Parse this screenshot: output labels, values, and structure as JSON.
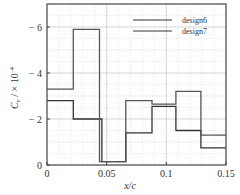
{
  "chart_data": {
    "type": "line",
    "title": "",
    "xlabel": "x/c",
    "ylabel": "C_v / × 10^-4",
    "xlim": [
      0,
      0.15
    ],
    "ylim": [
      0,
      -7
    ],
    "x_ticks": [
      "0",
      "0.05",
      "0.1",
      "0.15"
    ],
    "y_ticks": [
      "0",
      "− 2",
      "− 4",
      "− 6"
    ],
    "grid": true,
    "legend_position": "upper right",
    "series": [
      {
        "name": "design6",
        "step": true,
        "x": [
          0,
          0.022,
          0.022,
          0.046,
          0.046,
          0.066,
          0.066,
          0.088,
          0.088,
          0.108,
          0.108,
          0.129,
          0.129,
          0.15
        ],
        "y": [
          -2.8,
          -2.8,
          -2.0,
          -2.0,
          -0.15,
          -0.15,
          -1.4,
          -1.4,
          -2.55,
          -2.55,
          -1.5,
          -1.5,
          -0.75,
          -0.75
        ]
      },
      {
        "name": "design7",
        "step": true,
        "x": [
          0,
          0.022,
          0.022,
          0.044,
          0.044,
          0.066,
          0.066,
          0.088,
          0.088,
          0.108,
          0.108,
          0.129,
          0.129,
          0.15
        ],
        "y": [
          -3.3,
          -3.3,
          -5.9,
          -5.9,
          -0.15,
          -0.15,
          -2.8,
          -2.8,
          -2.65,
          -2.65,
          -3.2,
          -3.2,
          -1.3,
          -1.3
        ]
      }
    ]
  },
  "axes": {
    "xlabel": "x/c",
    "ylabel_main": "C",
    "ylabel_sub": "v",
    "ylabel_rest": " / × 10",
    "ylabel_exp": "−4"
  },
  "legend": {
    "items": [
      "design6",
      "design7"
    ]
  }
}
